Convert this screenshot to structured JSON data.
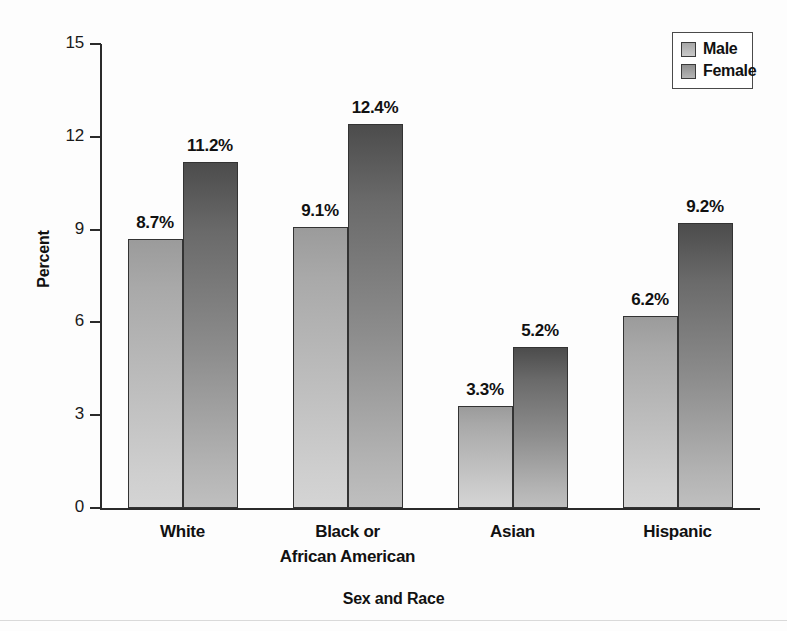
{
  "chart_data": {
    "type": "bar",
    "title": "",
    "subtitle": "",
    "xlabel": "Sex and Race",
    "ylabel": "Percent",
    "ylim": [
      0,
      15
    ],
    "yticks": [
      0,
      3,
      6,
      9,
      12,
      15
    ],
    "ytick_labels": [
      "0",
      "3",
      "6",
      "9",
      "12",
      "15"
    ],
    "grid": false,
    "legend_position": "top-right",
    "categories": [
      "White",
      "Black or African American",
      "Asian",
      "Hispanic"
    ],
    "category_label_lines": [
      [
        "White"
      ],
      [
        "Black or",
        "African American"
      ],
      [
        "Asian"
      ],
      [
        "Hispanic"
      ]
    ],
    "series": [
      {
        "name": "Male",
        "color": "#bdbdbd",
        "values": [
          8.7,
          9.1,
          3.3,
          6.2
        ],
        "data_labels": [
          "8.7%",
          "9.1%",
          "3.3%",
          "6.2%"
        ]
      },
      {
        "name": "Female",
        "color": "#8d8d8d",
        "values": [
          11.2,
          12.4,
          5.2,
          9.2
        ],
        "data_labels": [
          "11.2%",
          "12.4%",
          "5.2%",
          "9.2%"
        ]
      }
    ]
  },
  "legend": {
    "items": [
      {
        "label": "Male"
      },
      {
        "label": "Female"
      }
    ]
  },
  "colors": {
    "axis": "#2b2b2b",
    "text": "#111111",
    "background": "#fdfdfd",
    "male_bar": "#bdbdbd",
    "female_bar": "#8d8d8d",
    "legend_border": "#4a4a4a"
  }
}
